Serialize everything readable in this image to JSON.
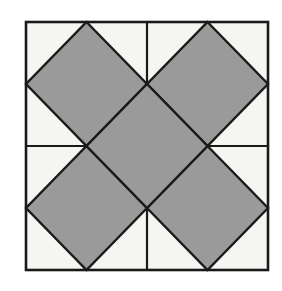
{
  "figure": {
    "shape_type": "geometric-tessellation",
    "colors": {
      "background": "#ffffff",
      "frame_fill": "#f5f5f2",
      "diamond_fill": "#9a9a9a",
      "line": "#1a1a1a"
    },
    "frame": {
      "x": 26,
      "y": 22,
      "width": 242,
      "height": 248,
      "stroke_width": 2.6
    },
    "grid": {
      "vertical_midline_x": 147,
      "horizontal_midline_y": 146,
      "stroke_width": 2.2
    },
    "diamond_half_width": 60.5,
    "diamond_half_height": 62,
    "diamonds": [
      {
        "name": "top-left-diamond",
        "cx": 86.5,
        "cy": 84
      },
      {
        "name": "top-right-diamond",
        "cx": 207.5,
        "cy": 84
      },
      {
        "name": "center-diamond",
        "cx": 147,
        "cy": 146
      },
      {
        "name": "bottom-left-diamond",
        "cx": 86.5,
        "cy": 208
      },
      {
        "name": "bottom-right-diamond",
        "cx": 207.5,
        "cy": 208
      }
    ],
    "counts": {
      "diamond_count": "5",
      "quadrant_count": "4",
      "white_corner_triangles": "8"
    }
  }
}
